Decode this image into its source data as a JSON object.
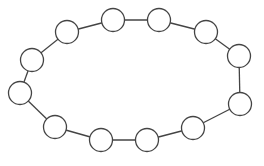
{
  "diagram": {
    "type": "cycle-graph",
    "node_count": 12,
    "nodes": [
      {
        "id": "n1"
      },
      {
        "id": "n2"
      },
      {
        "id": "n3"
      },
      {
        "id": "n4"
      },
      {
        "id": "n5"
      },
      {
        "id": "n6"
      },
      {
        "id": "n7"
      },
      {
        "id": "n8"
      },
      {
        "id": "n9"
      },
      {
        "id": "n10"
      },
      {
        "id": "n11"
      },
      {
        "id": "n12"
      }
    ],
    "edges": [
      [
        "n1",
        "n2"
      ],
      [
        "n2",
        "n3"
      ],
      [
        "n3",
        "n4"
      ],
      [
        "n4",
        "n5"
      ],
      [
        "n5",
        "n6"
      ],
      [
        "n6",
        "n7"
      ],
      [
        "n7",
        "n8"
      ],
      [
        "n8",
        "n9"
      ],
      [
        "n9",
        "n10"
      ],
      [
        "n10",
        "n11"
      ],
      [
        "n11",
        "n12"
      ],
      [
        "n12",
        "n1"
      ]
    ],
    "colors": {
      "stroke": "#444444",
      "node_fill": "#ffffff",
      "background": "#ffffff"
    }
  }
}
